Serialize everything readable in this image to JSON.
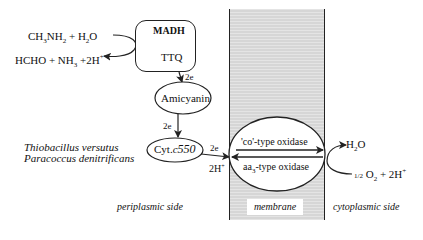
{
  "reaction": {
    "substrate": "CH3NH2 + H2O",
    "product": "HCHO + NH3 +2H+"
  },
  "nodes": {
    "madh": {
      "title": "MADH",
      "cofactor": "TTQ"
    },
    "amicyanin": "Amicyanin",
    "cytc": {
      "prefix": "Cyt.",
      "italic": "c",
      "number": "550"
    },
    "oxidase_top": "'co'-type oxidase",
    "oxidase_bottom": "aa3-type oxidase"
  },
  "electron_labels": {
    "madh_to_amicyanin": "2e",
    "amicyanin_to_cytc": "2e",
    "cytc_to_oxidase": "2e",
    "protons_periplasm": "2H+"
  },
  "cytoplasm_reaction": {
    "product": "H2O",
    "substrate": "1/2 O2 + 2H+"
  },
  "organisms": [
    "Thiobacillus versutus",
    "Paracoccus denitrificans"
  ],
  "regions": {
    "periplasm": "periplasmic side",
    "membrane": "membrane",
    "cytoplasm": "cytoplasmic side"
  },
  "colors": {
    "membrane_fill": "#d6d6d6",
    "line": "#222222"
  }
}
